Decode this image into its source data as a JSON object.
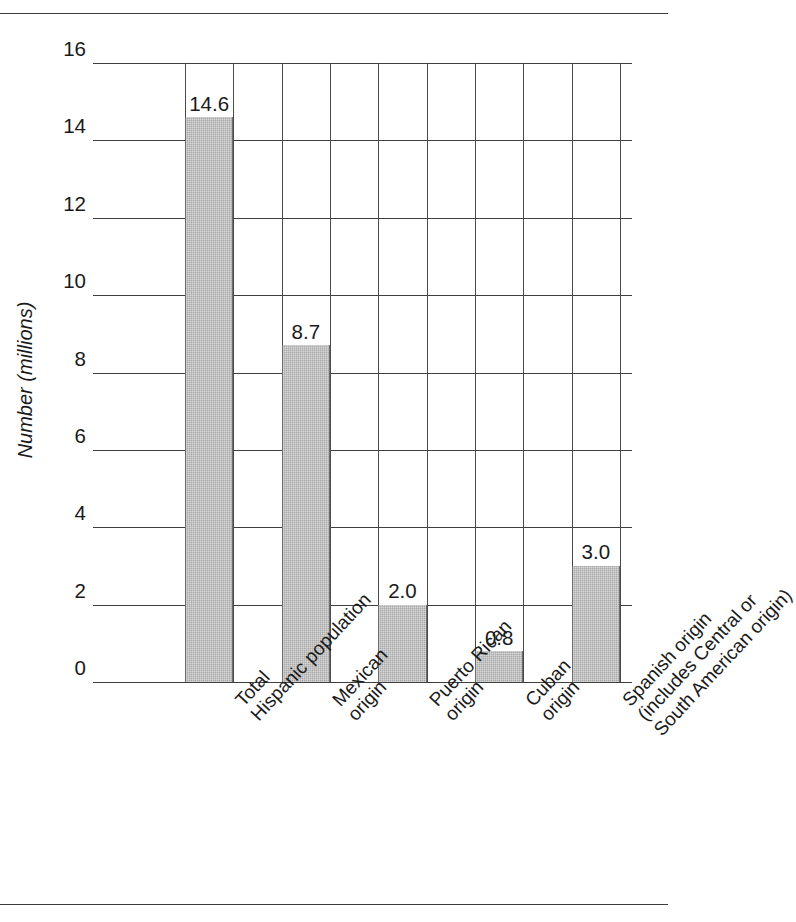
{
  "chart_data": {
    "type": "bar",
    "title": "",
    "subtitle": "",
    "xlabel": "",
    "ylabel": "Number (millions)",
    "ylim": [
      0,
      16
    ],
    "ytick_values": [
      0,
      2,
      4,
      6,
      8,
      10,
      12,
      14,
      16
    ],
    "ytick_labels": [
      "0",
      "2",
      "4",
      "6",
      "8",
      "10",
      "12",
      "14",
      "16"
    ],
    "grid": "both",
    "legend": "none",
    "categories": [
      "Total Hispanic population",
      "Mexican origin",
      "Puerto Rican origin",
      "Cuban origin",
      "Spanish origin (includes Central or South American origin)"
    ],
    "values": [
      14.6,
      8.7,
      2.0,
      0.8,
      3.0
    ],
    "value_labels": [
      "14.6",
      "8.7",
      "2.0",
      "0.8",
      "3.0"
    ],
    "bar_color": "#a9a9a9",
    "bar_edge_color": "#6e6e6e",
    "grid_color": "#3f3f3f",
    "bars": [
      {
        "value": 14.6,
        "label": "14.6",
        "category_lines": [
          "Total",
          "Hispanic population"
        ]
      },
      {
        "value": 8.7,
        "label": "8.7",
        "category_lines": [
          "Mexican",
          "origin"
        ]
      },
      {
        "value": 2.0,
        "label": "2.0",
        "category_lines": [
          "Puerto Rican",
          "origin"
        ]
      },
      {
        "value": 0.8,
        "label": "0.8",
        "category_lines": [
          "Cuban",
          "origin"
        ]
      },
      {
        "value": 3.0,
        "label": "3.0",
        "category_lines": [
          "Spanish origin",
          "(includes Central or",
          "South American origin)"
        ]
      }
    ]
  }
}
